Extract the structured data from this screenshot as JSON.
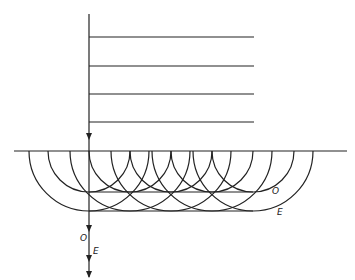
{
  "diagram": {
    "type": "huygens-wave-construction",
    "colors": {
      "line": "#222222",
      "background": "#ffffff"
    },
    "incident_wavefronts": {
      "count": 4,
      "y": [
        37,
        66,
        94,
        122
      ],
      "x_start": 89,
      "x_end": 254
    },
    "ray": {
      "x": 89,
      "y_start": 14,
      "y_end": 277
    },
    "interface": {
      "y": 151,
      "x_start": 14,
      "x_end": 347
    },
    "wavelet_centers_x": [
      89,
      130,
      171,
      212,
      253
    ],
    "ordinary_radius": 41,
    "extraordinary_radius": 60,
    "labels": {
      "ordinary_front": "O",
      "extraordinary_front": "E",
      "ordinary_ray": "O",
      "extraordinary_ray": "E"
    }
  }
}
